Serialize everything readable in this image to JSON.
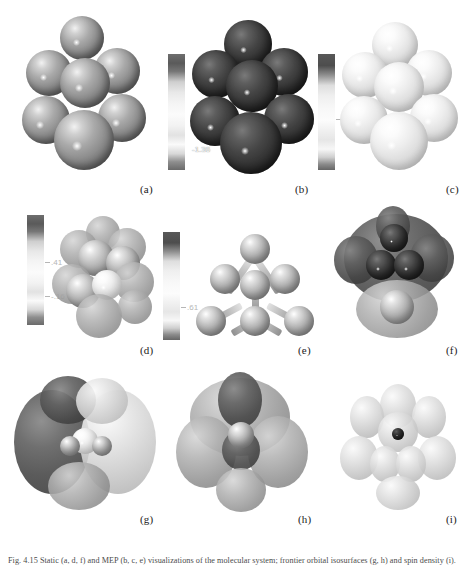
{
  "figure": {
    "columns": 3,
    "rows": 3,
    "background_color": "#ffffff",
    "caption": "Fig. 4.15 Static (a, d, f) and MEP (b, c, e) visualizations of the molecular system; frontier orbital isosurfaces (g, h) and spin density (i).",
    "panels": [
      {
        "id": "a",
        "label": "(a)",
        "kind": "space-filling-model",
        "shading": "grey",
        "has_colorbar": false,
        "colorbar": null
      },
      {
        "id": "b",
        "label": "(b)",
        "kind": "electrostatic-potential-surface",
        "shading": "dark",
        "has_colorbar": true,
        "colorbar": {
          "orientation": "vertical",
          "ticks": [
            {
              "value": ".891",
              "position_pct": 44
            },
            {
              "value": "-1.36",
              "position_pct": 78
            }
          ]
        }
      },
      {
        "id": "c",
        "label": "(c)",
        "kind": "electrostatic-potential-surface",
        "shading": "light",
        "has_colorbar": true,
        "colorbar": {
          "orientation": "vertical",
          "ticks": [
            {
              "value": ".74",
              "position_pct": 50
            }
          ]
        }
      },
      {
        "id": "d",
        "label": "(d)",
        "kind": "electrostatic-potential-surface",
        "shading": "mid",
        "has_colorbar": true,
        "colorbar": {
          "orientation": "vertical",
          "ticks": [
            {
              "value": ".41",
              "position_pct": 40
            },
            {
              "value": "-.16",
              "position_pct": 70
            }
          ]
        }
      },
      {
        "id": "e",
        "label": "(e)",
        "kind": "ball-and-stick-model",
        "shading": "mid",
        "has_colorbar": true,
        "colorbar": {
          "orientation": "vertical",
          "ticks": [
            {
              "value": ".61",
              "position_pct": 72
            }
          ]
        }
      },
      {
        "id": "f",
        "label": "(f)",
        "kind": "transparent-isosurface-overlay",
        "shading": "dark",
        "has_colorbar": false,
        "colorbar": null
      },
      {
        "id": "g",
        "label": "(g)",
        "kind": "molecular-orbital-isosurface",
        "shading": "dual-lobe",
        "has_colorbar": false,
        "colorbar": null
      },
      {
        "id": "h",
        "label": "(h)",
        "kind": "molecular-orbital-isosurface",
        "shading": "dual-lobe",
        "has_colorbar": false,
        "colorbar": null
      },
      {
        "id": "i",
        "label": "(i)",
        "kind": "spin-density-isosurface",
        "shading": "light",
        "has_colorbar": false,
        "colorbar": null
      }
    ]
  }
}
